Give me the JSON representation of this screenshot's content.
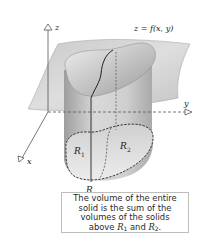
{
  "figure": {
    "surface_label": "z = f(x, y)",
    "axes": {
      "x": "x",
      "y": "y",
      "z": "z"
    },
    "region_label": "R",
    "subregions": [
      {
        "label": "R",
        "subscript": "1"
      },
      {
        "label": "R",
        "subscript": "2"
      }
    ],
    "colors": {
      "surface": "#d4d4d4",
      "surface_edge": "#9a9a9a",
      "cylinder": "#c8c8c8",
      "region_fill": "#e2e2e2",
      "outline": "#333333"
    }
  },
  "caption": {
    "lines": [
      "The volume of the entire",
      "solid is the sum of the",
      "volumes of the solids"
    ],
    "last_line_prefix": "above ",
    "r1": "R",
    "r1_sub": "1",
    "conj": " and ",
    "r2": "R",
    "r2_sub": "2",
    "suffix": "."
  }
}
